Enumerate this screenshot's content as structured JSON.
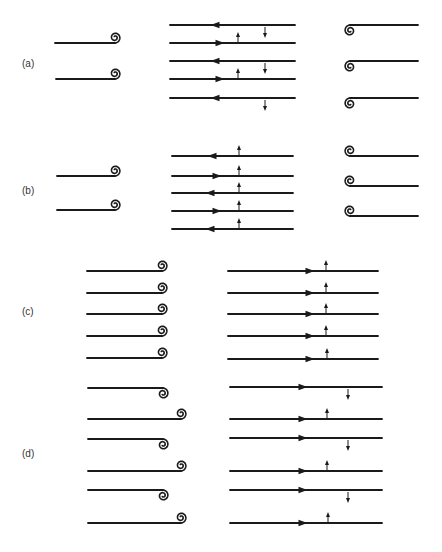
{
  "figure": {
    "stroke_color": "#1a1a1a",
    "label_color": "#333333",
    "panels": [
      {
        "id": "a",
        "label": "(a)",
        "label_pos": [
          22,
          65
        ],
        "left": {
          "lines": [
            {
              "y": 43,
              "x1": 55,
              "x2": 115,
              "spiral": "above-right"
            },
            {
              "y": 79,
              "x1": 56,
              "x2": 115,
              "spiral": "above-right"
            }
          ]
        },
        "middle": {
          "x1": 170,
          "x2": 295,
          "lines": [
            {
              "y": 25,
              "dir": "left",
              "arrow_x": 215,
              "perturbation": "down",
              "px": 265
            },
            {
              "y": 43,
              "dir": "right",
              "arrow_x": 220,
              "perturbation": "up",
              "px": 238
            },
            {
              "y": 61,
              "dir": "left",
              "arrow_x": 215,
              "perturbation": "down",
              "px": 265
            },
            {
              "y": 79,
              "dir": "right",
              "arrow_x": 220,
              "perturbation": "up",
              "px": 238
            },
            {
              "y": 98,
              "dir": "left",
              "arrow_x": 215,
              "perturbation": "down",
              "px": 265
            }
          ]
        },
        "right": {
          "lines": [
            {
              "y": 25,
              "x1": 350,
              "x2": 418,
              "spiral": "below-left"
            },
            {
              "y": 61,
              "x1": 350,
              "x2": 418,
              "spiral": "below-left"
            },
            {
              "y": 98,
              "x1": 350,
              "x2": 418,
              "spiral": "below-left"
            }
          ]
        }
      },
      {
        "id": "b",
        "label": "(b)",
        "label_pos": [
          22,
          192
        ],
        "left": {
          "lines": [
            {
              "y": 176,
              "x1": 57,
              "x2": 115,
              "spiral": "above-right"
            },
            {
              "y": 210,
              "x1": 57,
              "x2": 115,
              "spiral": "above-right"
            }
          ]
        },
        "middle": {
          "x1": 172,
          "x2": 293,
          "lines": [
            {
              "y": 156,
              "dir": "left",
              "arrow_x": 212,
              "perturbation": "up",
              "px": 239
            },
            {
              "y": 176,
              "dir": "right",
              "arrow_x": 217,
              "perturbation": "up",
              "px": 239
            },
            {
              "y": 193,
              "dir": "left",
              "arrow_x": 210,
              "perturbation": "up",
              "px": 239
            },
            {
              "y": 211,
              "dir": "right",
              "arrow_x": 217,
              "perturbation": "up",
              "px": 239
            },
            {
              "y": 229,
              "dir": "left",
              "arrow_x": 210,
              "perturbation": "up",
              "px": 239
            }
          ]
        },
        "right": {
          "lines": [
            {
              "y": 156,
              "x1": 350,
              "x2": 418,
              "spiral": "above-left"
            },
            {
              "y": 186,
              "x1": 350,
              "x2": 418,
              "spiral": "above-left"
            },
            {
              "y": 216,
              "x1": 350,
              "x2": 418,
              "spiral": "above-left"
            }
          ]
        }
      },
      {
        "id": "c",
        "label": "(c)",
        "label_pos": [
          22,
          313
        ],
        "left": {
          "lines": [
            {
              "y": 271,
              "x1": 87,
              "x2": 162,
              "spiral": "above-right"
            },
            {
              "y": 293,
              "x1": 87,
              "x2": 162,
              "spiral": "above-right"
            },
            {
              "y": 314,
              "x1": 87,
              "x2": 162,
              "spiral": "above-right"
            },
            {
              "y": 336,
              "x1": 87,
              "x2": 162,
              "spiral": "above-right"
            },
            {
              "y": 358,
              "x1": 87,
              "x2": 162,
              "spiral": "above-right"
            }
          ]
        },
        "middle": {
          "x1": 228,
          "x2": 378,
          "lines": [
            {
              "y": 271,
              "dir": "right",
              "arrow_x": 310,
              "perturbation": "up",
              "px": 326
            },
            {
              "y": 293,
              "dir": "right",
              "arrow_x": 310,
              "perturbation": "up",
              "px": 326
            },
            {
              "y": 314,
              "dir": "right",
              "arrow_x": 310,
              "perturbation": "up",
              "px": 326
            },
            {
              "y": 336,
              "dir": "right",
              "arrow_x": 310,
              "perturbation": "up",
              "px": 326
            },
            {
              "y": 359,
              "dir": "right",
              "arrow_x": 310,
              "perturbation": "up",
              "px": 327
            }
          ]
        }
      },
      {
        "id": "d",
        "label": "(d)",
        "label_pos": [
          22,
          455
        ],
        "left": {
          "pairs": [
            {
              "top_y": 388,
              "bottom_y": 419
            },
            {
              "top_y": 439,
              "bottom_y": 471
            },
            {
              "top_y": 490,
              "bottom_y": 523
            }
          ],
          "x1": 88,
          "x2_top": 163,
          "x2_bottom": 181
        },
        "middle": {
          "x1": 230,
          "x2": 382,
          "lines": [
            {
              "y": 387,
              "dir": "right",
              "arrow_x": 303,
              "perturbation": "down",
              "px": 348
            },
            {
              "y": 419,
              "dir": "right",
              "arrow_x": 303,
              "perturbation": "up",
              "px": 327
            },
            {
              "y": 438,
              "dir": "right",
              "arrow_x": 303,
              "perturbation": "down",
              "px": 348
            },
            {
              "y": 471,
              "dir": "right",
              "arrow_x": 303,
              "perturbation": "up",
              "px": 327
            },
            {
              "y": 490,
              "dir": "right",
              "arrow_x": 303,
              "perturbation": "down",
              "px": 348
            },
            {
              "y": 523,
              "dir": "right",
              "arrow_x": 303,
              "perturbation": "up",
              "px": 328
            }
          ]
        }
      }
    ]
  }
}
